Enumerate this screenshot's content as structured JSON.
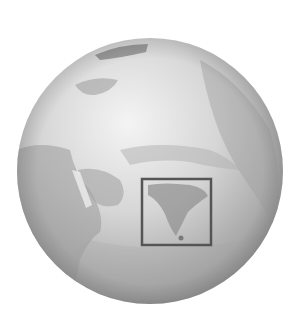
{
  "figure": {
    "highlight_region": "India",
    "colors": {
      "background": "#ffffff",
      "globe_light": "#f2f2f2",
      "globe_mid": "#bdbdbd",
      "globe_dark": "#8a8a8a",
      "land_dark": "#8c8c8c",
      "box_stroke": "#555555"
    },
    "globe": {
      "cx": 150,
      "cy": 171,
      "r": 133
    },
    "highlight_box": {
      "x": 141,
      "y": 178,
      "width": 71,
      "height": 68
    }
  }
}
